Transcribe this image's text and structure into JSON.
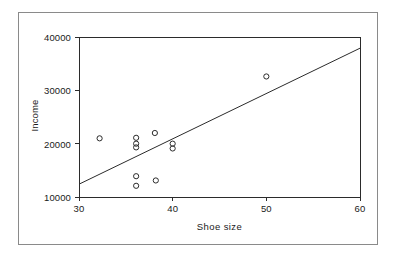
{
  "figure": {
    "background_color": "#ffffff",
    "frame_color": "#8a8a8a",
    "axis_color": "#2b2b2b",
    "marker_color": "#2b2b2b",
    "line_color": "#2b2b2b"
  },
  "chart_data": {
    "type": "scatter",
    "title": "",
    "xlabel": "Shoe size",
    "ylabel": "Income",
    "xlim": [
      30,
      60
    ],
    "ylim": [
      10000,
      40000
    ],
    "xticks": [
      30,
      40,
      50,
      60
    ],
    "yticks": [
      10000,
      20000,
      30000,
      40000
    ],
    "xtick_labels": [
      "30",
      "40",
      "50",
      "60"
    ],
    "ytick_labels": [
      "10000",
      "20000",
      "30000",
      "40000"
    ],
    "grid": false,
    "legend": null,
    "marker_style": "open-circle",
    "points": [
      {
        "x": 32.2,
        "y": 21000
      },
      {
        "x": 36.1,
        "y": 21100
      },
      {
        "x": 36.1,
        "y": 20000
      },
      {
        "x": 36.1,
        "y": 19300
      },
      {
        "x": 38.1,
        "y": 22000
      },
      {
        "x": 36.1,
        "y": 13900
      },
      {
        "x": 36.1,
        "y": 12100
      },
      {
        "x": 38.2,
        "y": 13100
      },
      {
        "x": 40.0,
        "y": 20000
      },
      {
        "x": 40.0,
        "y": 19100
      },
      {
        "x": 50.0,
        "y": 32600
      }
    ],
    "trend_line": {
      "label": "fitted regression line",
      "x_start": 30,
      "y_start": 12400,
      "x_end": 60,
      "y_end": 37900
    }
  }
}
